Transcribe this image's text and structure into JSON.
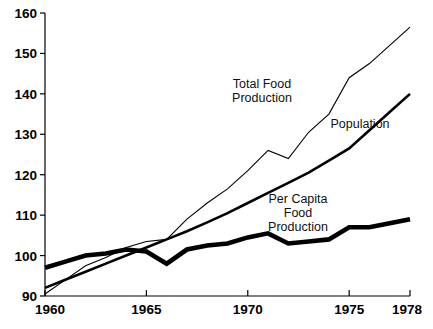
{
  "chart_data": {
    "type": "line",
    "title": "",
    "subtitle": "",
    "xlabel": "",
    "ylabel": "",
    "xlim": [
      1960,
      1978
    ],
    "ylim": [
      90,
      160
    ],
    "grid": false,
    "legend_position": "inline-annotations",
    "index_base": "1960 = 100 index",
    "x_ticks": [
      1960,
      1965,
      1970,
      1975,
      1978
    ],
    "y_ticks": [
      90,
      100,
      110,
      120,
      130,
      140,
      150,
      160
    ],
    "x": [
      1960,
      1961,
      1962,
      1963,
      1964,
      1965,
      1966,
      1967,
      1968,
      1969,
      1970,
      1971,
      1972,
      1973,
      1974,
      1975,
      1976,
      1977,
      1978
    ],
    "series": [
      {
        "name": "Total Food Production",
        "stroke_width": 1.1,
        "color": "#000000",
        "label_lines": [
          "Total Food",
          "Production"
        ],
        "label_x": 262,
        "label_y": 88,
        "values": [
          90.5,
          94.0,
          97.5,
          99.5,
          102.0,
          103.5,
          104.0,
          109.0,
          113.0,
          116.5,
          121.0,
          126.0,
          124.0,
          130.5,
          135.0,
          144.0,
          147.5,
          152.0,
          156.5
        ]
      },
      {
        "name": "Population",
        "stroke_width": 2.6,
        "color": "#000000",
        "label_lines": [
          "Population"
        ],
        "label_x": 360,
        "label_y": 128,
        "values": [
          92.0,
          94.0,
          96.0,
          98.0,
          100.0,
          102.0,
          104.0,
          106.0,
          108.2,
          110.5,
          113.0,
          115.5,
          118.0,
          120.5,
          123.5,
          126.5,
          131.0,
          135.5,
          140.0
        ]
      },
      {
        "name": "Per Capita Food Production",
        "stroke_width": 4.6,
        "color": "#000000",
        "label_lines": [
          "Per Capita",
          "Food",
          "Production"
        ],
        "label_x": 298,
        "label_y": 203,
        "values": [
          97.0,
          98.5,
          100.0,
          100.5,
          101.5,
          101.0,
          98.0,
          101.5,
          102.5,
          103.0,
          104.5,
          105.5,
          103.0,
          103.5,
          104.0,
          107.0,
          107.0,
          108.0,
          109.0
        ]
      }
    ]
  },
  "axes": {
    "x_tick_labels": [
      "1960",
      "1965",
      "1970",
      "1975",
      "1978"
    ],
    "y_tick_labels": [
      "90",
      "100",
      "110",
      "120",
      "130",
      "140",
      "150",
      "160"
    ]
  }
}
